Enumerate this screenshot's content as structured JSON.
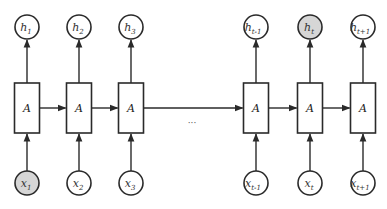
{
  "diagram": {
    "colors": {
      "stroke": "#2a2a2a",
      "node_fill": "#ffffff",
      "highlight_fill": "#d6d6d6",
      "box_fill": "#ffffff"
    },
    "cell_label": "A",
    "ellipsis": "···",
    "timesteps": [
      {
        "cx": 27,
        "output": {
          "base": "h",
          "sub": "1",
          "highlight": false
        },
        "input": {
          "base": "x",
          "sub": "1",
          "highlight": true
        },
        "cell": "A"
      },
      {
        "cx": 79,
        "output": {
          "base": "h",
          "sub": "2",
          "highlight": false
        },
        "input": {
          "base": "x",
          "sub": "2",
          "highlight": false
        },
        "cell": "A"
      },
      {
        "cx": 131,
        "output": {
          "base": "h",
          "sub": "3",
          "highlight": false
        },
        "input": {
          "base": "x",
          "sub": "3",
          "highlight": false
        },
        "cell": "A"
      },
      {
        "cx": 256,
        "output": {
          "base": "h",
          "sub": "t-1",
          "highlight": false
        },
        "input": {
          "base": "x",
          "sub": "t-1",
          "highlight": false
        },
        "cell": "A"
      },
      {
        "cx": 310,
        "output": {
          "base": "h",
          "sub": "t",
          "highlight": true
        },
        "input": {
          "base": "x",
          "sub": "t",
          "highlight": false
        },
        "cell": "A"
      },
      {
        "cx": 363,
        "output": {
          "base": "h",
          "sub": "t+1",
          "highlight": false
        },
        "input": {
          "base": "x",
          "sub": "t+1",
          "highlight": false
        },
        "cell": "A"
      }
    ],
    "recurrent_edges": [
      {
        "from": 0,
        "to": 1
      },
      {
        "from": 1,
        "to": 2
      },
      {
        "from": 2,
        "to": 3
      },
      {
        "from": 3,
        "to": 4
      },
      {
        "from": 4,
        "to": 5
      }
    ]
  }
}
